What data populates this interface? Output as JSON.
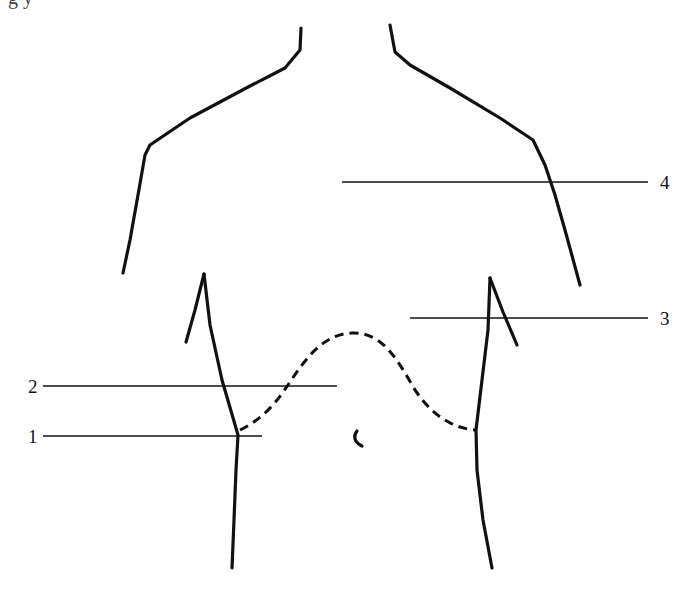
{
  "caption": {
    "text": "g          y"
  },
  "figure": {
    "labels": [
      {
        "id": "1",
        "text": "1",
        "x": 28,
        "y": 443
      },
      {
        "id": "2",
        "text": "2",
        "x": 28,
        "y": 393
      },
      {
        "id": "3",
        "text": "3",
        "x": 660,
        "y": 325
      },
      {
        "id": "4",
        "text": "4",
        "x": 660,
        "y": 189
      }
    ],
    "leaders": [
      {
        "id": "1",
        "x1": 43,
        "x2": 262,
        "y": 436
      },
      {
        "id": "2",
        "x1": 43,
        "x2": 337,
        "y": 386
      },
      {
        "id": "3",
        "x1": 410,
        "x2": 648,
        "y": 318
      },
      {
        "id": "4",
        "x1": 342,
        "x2": 648,
        "y": 182
      }
    ],
    "colors": {
      "stroke": "#111111",
      "background": "#ffffff"
    }
  }
}
